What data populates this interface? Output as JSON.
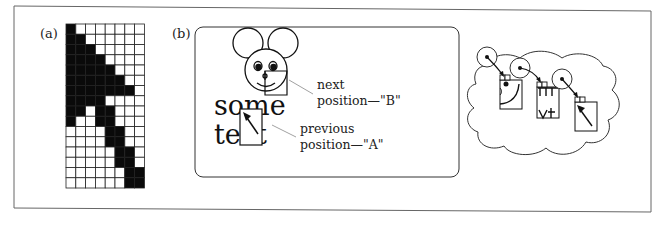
{
  "figure": {
    "frame_color": "#555555",
    "ink_color": "#111111",
    "leader_color": "#888888"
  },
  "panel_a": {
    "label": "(a)",
    "grid": {
      "cols": 8,
      "rows": 16,
      "x": 66,
      "y": 24,
      "cell_w": 9.8,
      "cell_h": 10.25,
      "filled_cells_by_row": [
        [
          0
        ],
        [
          0,
          1
        ],
        [
          0,
          1,
          2
        ],
        [
          0,
          1,
          2,
          3
        ],
        [
          0,
          1,
          2,
          3,
          4
        ],
        [
          0,
          1,
          2,
          3,
          4,
          5
        ],
        [
          0,
          1,
          2,
          3,
          4,
          5,
          6
        ],
        [
          0,
          1,
          2,
          3
        ],
        [
          0,
          1,
          3,
          4
        ],
        [
          0,
          3,
          4
        ],
        [
          4,
          5
        ],
        [
          4,
          5
        ],
        [
          5,
          6
        ],
        [
          5,
          6
        ],
        [
          6,
          7
        ],
        [
          6,
          7
        ]
      ]
    }
  },
  "panel_b": {
    "label": "(b)",
    "sample_text": [
      "some",
      "text"
    ],
    "callouts": [
      {
        "line1": "next",
        "line2": "position—\"B\""
      },
      {
        "line1": "previous",
        "line2": "position—\"A\""
      }
    ],
    "cloud_diagram": {
      "circles": 3,
      "boxes": 3
    }
  }
}
